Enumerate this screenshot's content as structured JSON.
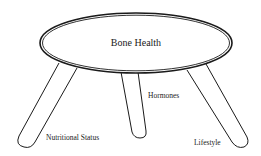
{
  "diagram": {
    "type": "three-legged stool metaphor",
    "seat": {
      "label": "Bone Health"
    },
    "legs": [
      {
        "label": "Nutritional Status"
      },
      {
        "label": "Hormones"
      },
      {
        "label": "Lifestyle"
      }
    ],
    "colors": {
      "stroke": "#1a1a1a",
      "background": "#ffffff"
    }
  }
}
